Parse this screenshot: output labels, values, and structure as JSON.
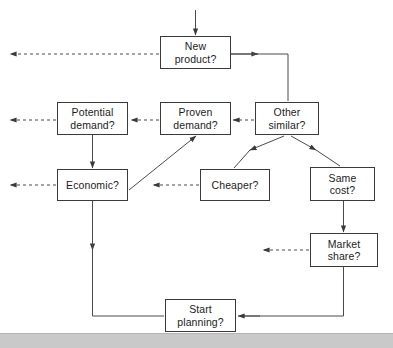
{
  "diagram": {
    "background_color": "#ffffff",
    "box_border_color": "#3a3a3a",
    "text_color": "#1c1c1c",
    "line_color": "#4a4a4a",
    "nodes": [
      {
        "id": "new-product",
        "label": "New\nproduct?",
        "x": 160,
        "y": 36,
        "w": 71,
        "h": 33
      },
      {
        "id": "potential-demand",
        "label": "Potential\ndemand?",
        "x": 57,
        "y": 102,
        "w": 71,
        "h": 33
      },
      {
        "id": "proven-demand",
        "label": "Proven\ndemand?",
        "x": 160,
        "y": 102,
        "w": 71,
        "h": 33
      },
      {
        "id": "other-similar",
        "label": "Other\nsimilar?",
        "x": 255,
        "y": 102,
        "w": 64,
        "h": 33
      },
      {
        "id": "economic",
        "label": "Economic?",
        "x": 57,
        "y": 169,
        "w": 71,
        "h": 32
      },
      {
        "id": "cheaper",
        "label": "Cheaper?",
        "x": 200,
        "y": 169,
        "w": 70,
        "h": 32
      },
      {
        "id": "same-cost",
        "label": "Same\ncost?",
        "x": 310,
        "y": 167,
        "w": 65,
        "h": 34
      },
      {
        "id": "market-share",
        "label": "Market\nshare?",
        "x": 310,
        "y": 233,
        "w": 68,
        "h": 34
      },
      {
        "id": "start-planning",
        "label": "Start\nplanning?",
        "x": 165,
        "y": 299,
        "w": 71,
        "h": 33
      }
    ],
    "bottom_bar": {
      "color": "#c9c9c9",
      "y": 333,
      "height": 14
    }
  }
}
